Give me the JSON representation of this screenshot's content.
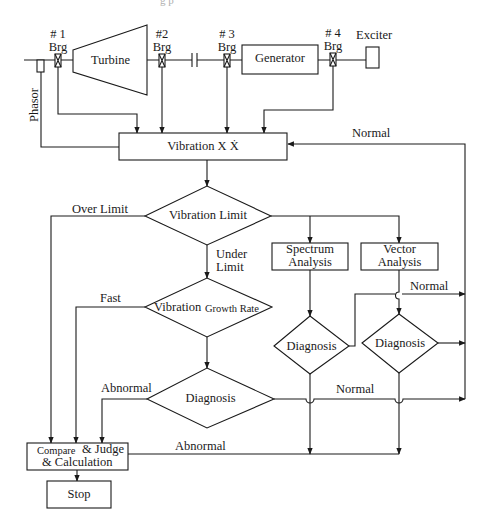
{
  "caption_fragment": "g    p",
  "machine": {
    "bearings": [
      {
        "num": "# 1",
        "label": "Brg"
      },
      {
        "num": "#2",
        "label": "Brg"
      },
      {
        "num": "# 3",
        "label": "Brg"
      },
      {
        "num": "# 4",
        "label": "Brg"
      }
    ],
    "turbine": "Turbine",
    "generator": "Generator",
    "exciter": "Exciter",
    "phasor": "Phasor"
  },
  "nodes": {
    "vibration": "Vibration  X  Ẋ",
    "vibration_limit": "Vibration Limit",
    "growth_rate_a": "Vibration",
    "growth_rate_b": "Growth Rate",
    "diagnosis_main": "Diagnosis",
    "spectrum_1": "Spectrum",
    "spectrum_2": "Analysis",
    "vector_1": "Vector",
    "vector_2": "Analysis",
    "diagnosis_spectrum": "Diagnosis",
    "diagnosis_vector": "Diagnosis",
    "compare_1a": "Compare",
    "compare_1b": "& Judge",
    "compare_2": "& Calculation",
    "stop": "Stop"
  },
  "edge_labels": {
    "normal_top": "Normal",
    "over_limit": "Over Limit",
    "under_1": "Under",
    "under_2": "Limit",
    "fast": "Fast",
    "abnormal_left": "Abnormal",
    "normal_mid_right": "Normal",
    "normal_bottom": "Normal",
    "abnormal_bottom": "Abnormal"
  }
}
